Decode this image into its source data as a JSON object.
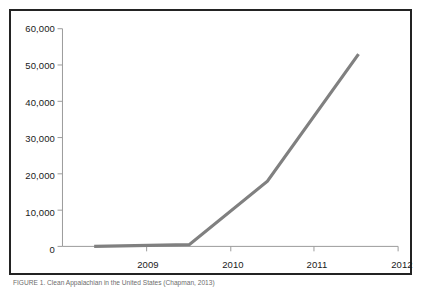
{
  "figure": {
    "caption": "FIGURE 1.  Clean Appalachian in the United States (Chapman, 2013)"
  },
  "chart_data": {
    "type": "line",
    "title": "",
    "xlabel": "",
    "ylabel": "",
    "categories": [
      "2009",
      "2010",
      "2011",
      "2012"
    ],
    "x": [
      2009,
      2010,
      2011,
      2012
    ],
    "values": [
      0,
      500,
      18000,
      53000
    ],
    "series": [
      {
        "name": "series-1",
        "color": "#808080",
        "values": [
          0,
          500,
          18000,
          53000
        ]
      }
    ],
    "ylim": [
      0,
      60000
    ],
    "ytick_labels": [
      "0",
      "10,000",
      "20,000",
      "30,000",
      "40,000",
      "50,000",
      "60,000"
    ],
    "ytick_values": [
      0,
      10000,
      20000,
      30000,
      40000,
      50000,
      60000
    ],
    "xtick_labels": [
      "2009",
      "2010",
      "2011",
      "2012"
    ],
    "grid": false,
    "legend": false,
    "legend_position": "none",
    "line_color": "#808080",
    "axis_color": "#9a9a9a",
    "border_color": "#232323"
  }
}
